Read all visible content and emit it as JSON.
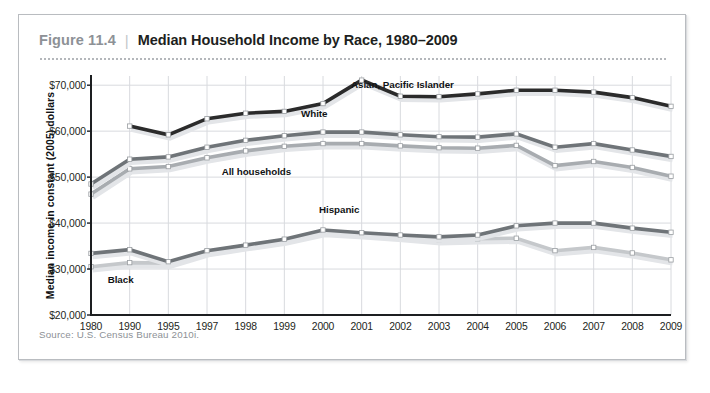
{
  "figure": {
    "number": "Figure 11.4",
    "separator": "|",
    "title": "Median Household Income by Race, 1980–2009",
    "source": "Source: U.S. Census Bureau 2010i."
  },
  "colors": {
    "asian": "#2b2b2b",
    "white": "#6f7478",
    "all_households": "#a8acb0",
    "hispanic": "#6f7478",
    "black": "#c5c8cb",
    "grid": "#d8dade",
    "axis": "#1d1f21",
    "frame": "#b9bcc0",
    "fig_number": "#8d9196",
    "source_text": "#8d9196"
  },
  "chart_data": {
    "type": "line",
    "title": "Median Household Income by Race, 1980–2009",
    "xlabel": "",
    "ylabel": "Median income in constant (2005) dollars",
    "ylim": [
      20000,
      72000
    ],
    "yticks": [
      20000,
      30000,
      40000,
      50000,
      60000,
      70000
    ],
    "ytick_labels": [
      "$20,000",
      "$30,000",
      "$40,000",
      "$50,000",
      "$60,000",
      "$70,000"
    ],
    "grid": true,
    "legend": "inline-labels",
    "categories": [
      "1980",
      "1990",
      "1995",
      "1997",
      "1998",
      "1999",
      "2000",
      "2001",
      "2002",
      "2003",
      "2004",
      "2005",
      "2006",
      "2007",
      "2008",
      "2009"
    ],
    "series": [
      {
        "name": "Asian, Pacific Islander",
        "color": "#2b2b2b",
        "label": "Asian, Pacific Islander",
        "values": [
          null,
          61100,
          59200,
          62700,
          63900,
          64300,
          66000,
          71100,
          67600,
          67500,
          68100,
          68900,
          68900,
          68500,
          67300,
          65400
        ]
      },
      {
        "name": "White",
        "color": "#6f7478",
        "label": "White",
        "values": [
          48500,
          53900,
          54400,
          56500,
          58000,
          59000,
          59800,
          59800,
          59200,
          58800,
          58700,
          59400,
          56500,
          57300,
          55900,
          54500
        ]
      },
      {
        "name": "All households",
        "color": "#a8acb0",
        "label": "All households",
        "values": [
          46300,
          51800,
          52300,
          54200,
          55700,
          56700,
          57300,
          57300,
          56800,
          56400,
          56300,
          56900,
          52500,
          53400,
          52100,
          50200
        ]
      },
      {
        "name": "Hispanic",
        "color": "#6f7478",
        "label": "Hispanic",
        "values": [
          33400,
          34200,
          31600,
          34000,
          35200,
          36500,
          38500,
          37900,
          37400,
          37000,
          37400,
          39400,
          40000,
          40000,
          38900,
          38000
        ]
      },
      {
        "name": "Black",
        "color": "#c5c8cb",
        "label": "Black",
        "values": [
          30500,
          31400,
          31300,
          33800,
          35100,
          36300,
          38200,
          37700,
          37100,
          36400,
          36600,
          36700,
          34000,
          34700,
          33500,
          32000
        ]
      }
    ]
  }
}
